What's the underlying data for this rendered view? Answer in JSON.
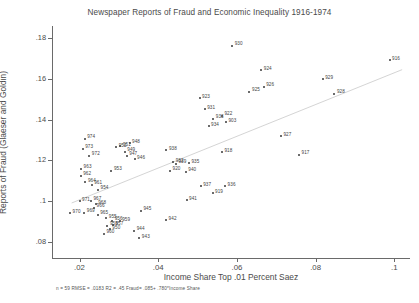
{
  "chart_data": {
    "type": "scatter",
    "title": "Newspaper Reports of Fraud and Economic Inequality 1916-1974",
    "xlabel": "Income Share Top .01 Percent Saez",
    "ylabel": "Reports of Fraud (Glaeser and Goldin)",
    "xlim": [
      0.013,
      0.104
    ],
    "ylim": [
      0.072,
      0.186
    ],
    "xticks": [
      ".02",
      ".04",
      ".06",
      ".08",
      ".1"
    ],
    "xtick_values": [
      0.02,
      0.04,
      0.06,
      0.08,
      0.1
    ],
    "yticks": [
      ".08",
      ".1",
      ".12",
      ".14",
      ".16",
      ".18"
    ],
    "ytick_values": [
      0.08,
      0.1,
      0.12,
      0.14,
      0.16,
      0.18
    ],
    "grid": false,
    "legend": null,
    "fit_line": {
      "intercept": 0.085,
      "slope": 0.78,
      "x_start": 0.018,
      "x_end": 0.102
    },
    "annotation": "n = 59    RMSE =  .0183  R2 = .45  Fraud= .085+ .780*Income Share",
    "stats": {
      "n": 59,
      "rmse": 0.0183,
      "r2": 0.45,
      "equation": "Fraud= .085+ .780*Income Share"
    },
    "point_label_note": "labels are three-digit year abbreviations, e.g. 974 = 1974",
    "points": [
      {
        "label": "974",
        "x": 0.0213,
        "y": 0.1305,
        "side": "right"
      },
      {
        "label": "973",
        "x": 0.0208,
        "y": 0.1258,
        "side": "right"
      },
      {
        "label": "972",
        "x": 0.0225,
        "y": 0.1222,
        "side": "right"
      },
      {
        "label": "963",
        "x": 0.0204,
        "y": 0.1158,
        "side": "right"
      },
      {
        "label": "962",
        "x": 0.0203,
        "y": 0.1125,
        "side": "right"
      },
      {
        "label": "964",
        "x": 0.0215,
        "y": 0.1092,
        "side": "right"
      },
      {
        "label": "961",
        "x": 0.0231,
        "y": 0.108,
        "side": "right"
      },
      {
        "label": "954",
        "x": 0.0247,
        "y": 0.1055,
        "side": "right"
      },
      {
        "label": "971",
        "x": 0.02,
        "y": 0.1,
        "side": "right"
      },
      {
        "label": "967",
        "x": 0.0229,
        "y": 0.1002,
        "side": "right"
      },
      {
        "label": "968",
        "x": 0.0241,
        "y": 0.0985,
        "side": "right"
      },
      {
        "label": "966",
        "x": 0.0237,
        "y": 0.0968,
        "side": "right"
      },
      {
        "label": "970",
        "x": 0.0176,
        "y": 0.094,
        "side": "right"
      },
      {
        "label": "969",
        "x": 0.0212,
        "y": 0.0942,
        "side": "right"
      },
      {
        "label": "965",
        "x": 0.0246,
        "y": 0.0933,
        "side": "right"
      },
      {
        "label": "955",
        "x": 0.0268,
        "y": 0.0915,
        "side": "right"
      },
      {
        "label": "956",
        "x": 0.0283,
        "y": 0.0902,
        "side": "right"
      },
      {
        "label": "959",
        "x": 0.0302,
        "y": 0.09,
        "side": "right"
      },
      {
        "label": "957",
        "x": 0.0285,
        "y": 0.0882,
        "side": "right"
      },
      {
        "label": "958",
        "x": 0.0271,
        "y": 0.0878,
        "side": "right"
      },
      {
        "label": "950",
        "x": 0.0277,
        "y": 0.0862,
        "side": "right"
      },
      {
        "label": "960",
        "x": 0.0262,
        "y": 0.0838,
        "side": "right"
      },
      {
        "label": "951",
        "x": 0.0304,
        "y": 0.1268,
        "side": "right"
      },
      {
        "label": "952",
        "x": 0.0293,
        "y": 0.1265,
        "side": "right"
      },
      {
        "label": "948",
        "x": 0.0327,
        "y": 0.1285,
        "side": "right"
      },
      {
        "label": "947",
        "x": 0.032,
        "y": 0.1222,
        "side": "right"
      },
      {
        "label": "949",
        "x": 0.0315,
        "y": 0.1242,
        "side": "right"
      },
      {
        "label": "946",
        "x": 0.034,
        "y": 0.1205,
        "side": "right"
      },
      {
        "label": "953",
        "x": 0.0281,
        "y": 0.1148,
        "side": "right"
      },
      {
        "label": "945",
        "x": 0.0356,
        "y": 0.0952,
        "side": "right"
      },
      {
        "label": "944",
        "x": 0.0339,
        "y": 0.0855,
        "side": "right"
      },
      {
        "label": "943",
        "x": 0.0352,
        "y": 0.0818,
        "side": "right"
      },
      {
        "label": "942",
        "x": 0.042,
        "y": 0.0905,
        "side": "right"
      },
      {
        "label": "941",
        "x": 0.0472,
        "y": 0.1005,
        "side": "right"
      },
      {
        "label": "940",
        "x": 0.047,
        "y": 0.1145,
        "side": "right"
      },
      {
        "label": "920",
        "x": 0.043,
        "y": 0.1148,
        "side": "right"
      },
      {
        "label": "939",
        "x": 0.0445,
        "y": 0.1182,
        "side": "right"
      },
      {
        "label": "932",
        "x": 0.0438,
        "y": 0.119,
        "side": "right"
      },
      {
        "label": "935",
        "x": 0.0478,
        "y": 0.1185,
        "side": "right"
      },
      {
        "label": "938",
        "x": 0.0421,
        "y": 0.125,
        "side": "right"
      },
      {
        "label": "937",
        "x": 0.0508,
        "y": 0.1072,
        "side": "right"
      },
      {
        "label": "936",
        "x": 0.057,
        "y": 0.1072,
        "side": "right"
      },
      {
        "label": "919",
        "x": 0.0538,
        "y": 0.1038,
        "side": "right"
      },
      {
        "label": "918",
        "x": 0.0562,
        "y": 0.124,
        "side": "right"
      },
      {
        "label": "923",
        "x": 0.0505,
        "y": 0.1505,
        "side": "right"
      },
      {
        "label": "931",
        "x": 0.0518,
        "y": 0.1452,
        "side": "right"
      },
      {
        "label": "922",
        "x": 0.0562,
        "y": 0.142,
        "side": "right"
      },
      {
        "label": "933",
        "x": 0.054,
        "y": 0.1405,
        "side": "right"
      },
      {
        "label": "903",
        "x": 0.0572,
        "y": 0.1388,
        "side": "right"
      },
      {
        "label": "934",
        "x": 0.0528,
        "y": 0.1368,
        "side": "right"
      },
      {
        "label": "930",
        "x": 0.0588,
        "y": 0.1762,
        "side": "right"
      },
      {
        "label": "924",
        "x": 0.0662,
        "y": 0.1642,
        "side": "right"
      },
      {
        "label": "925",
        "x": 0.0632,
        "y": 0.1538,
        "side": "right"
      },
      {
        "label": "926",
        "x": 0.0668,
        "y": 0.1562,
        "side": "right"
      },
      {
        "label": "927",
        "x": 0.0712,
        "y": 0.1318,
        "side": "right"
      },
      {
        "label": "917",
        "x": 0.0758,
        "y": 0.1228,
        "side": "right"
      },
      {
        "label": "929",
        "x": 0.0818,
        "y": 0.1598,
        "side": "right"
      },
      {
        "label": "928",
        "x": 0.0848,
        "y": 0.1528,
        "side": "right"
      },
      {
        "label": "916",
        "x": 0.0988,
        "y": 0.1692,
        "side": "right"
      }
    ]
  }
}
